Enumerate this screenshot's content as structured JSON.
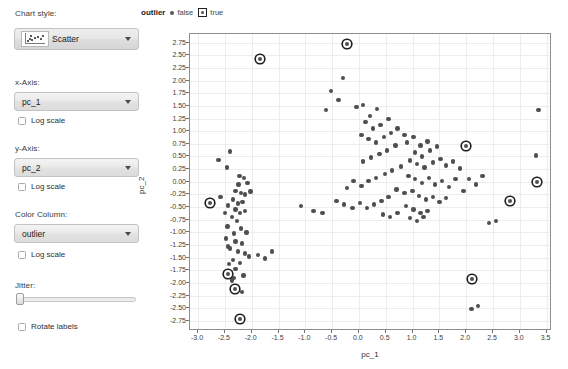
{
  "sidebar": {
    "chart_style_label": "Chart style:",
    "chart_style_value": "Scatter",
    "x_axis_label": "x-Axis:",
    "x_axis_value": "pc_1",
    "x_log_label": "Log scale",
    "y_axis_label": "y-Axis:",
    "y_axis_value": "pc_2",
    "y_log_label": "Log scale",
    "color_column_label": "Color Column:",
    "color_column_value": "outlier",
    "color_log_label": "Log scale",
    "jitter_label": "Jitter:",
    "rotate_labels_label": "Rotate labels"
  },
  "legend": {
    "title": "outlier",
    "items": [
      {
        "label": "false",
        "marker": "dot"
      },
      {
        "label": "true",
        "marker": "boxed-dot"
      }
    ]
  },
  "colors": {
    "point": "#4f4f52",
    "outlier_box": "#1f1f1f",
    "grid": "#ededed",
    "frame": "#8d8d8d",
    "panel": "#e4e4e4"
  },
  "chart_data": {
    "type": "scatter",
    "title": "",
    "xlabel": "pc_1",
    "ylabel": "pc_2",
    "xlim": [
      -3.15,
      3.6
    ],
    "ylim": [
      -2.95,
      2.92
    ],
    "xticks": [
      -3.0,
      -2.5,
      -2.0,
      -1.5,
      -1.0,
      -0.5,
      0.0,
      0.5,
      1.0,
      1.5,
      2.0,
      2.5,
      3.0,
      3.5
    ],
    "yticks": [
      2.75,
      2.5,
      2.25,
      2.0,
      1.75,
      1.5,
      1.25,
      1.0,
      0.75,
      0.5,
      0.25,
      0.0,
      -0.25,
      -0.5,
      -0.75,
      -1.0,
      -1.25,
      -1.5,
      -1.75,
      -2.0,
      -2.25,
      -2.5,
      -2.75
    ],
    "xtick_labels": [
      "-3.0",
      "-2.5",
      "-2.0",
      "-1.5",
      "-1.0",
      "-0.5",
      "0.0",
      "0.5",
      "1.0",
      "1.5",
      "2.0",
      "2.5",
      "3.0",
      "3.5"
    ],
    "ytick_labels": [
      "2.75",
      "2.50",
      "2.25",
      "2.00",
      "1.75",
      "1.50",
      "1.25",
      "1.00",
      "0.75",
      "0.50",
      "0.25",
      "0.00",
      "-0.25",
      "-0.50",
      "-0.75",
      "-1.00",
      "-1.25",
      "-1.50",
      "-1.75",
      "-2.00",
      "-2.25",
      "-2.50",
      "-2.75"
    ],
    "grid": true,
    "legend_position": "top-left-outside",
    "color_by": "outlier",
    "series": [
      {
        "name": "false",
        "marker": "circle",
        "color": "#4f4f52",
        "points": [
          [
            -2.62,
            0.43
          ],
          [
            -2.4,
            0.6
          ],
          [
            -2.46,
            0.28
          ],
          [
            -2.23,
            0.12
          ],
          [
            -2.14,
            0.07
          ],
          [
            -2.25,
            -0.05
          ],
          [
            -2.08,
            -0.02
          ],
          [
            -2.3,
            -0.18
          ],
          [
            -2.2,
            -0.22
          ],
          [
            -2.13,
            -0.25
          ],
          [
            -2.02,
            -0.19
          ],
          [
            -2.35,
            -0.35
          ],
          [
            -2.44,
            -0.47
          ],
          [
            -2.26,
            -0.43
          ],
          [
            -2.17,
            -0.4
          ],
          [
            -2.3,
            -0.55
          ],
          [
            -2.22,
            -0.62
          ],
          [
            -2.12,
            -0.58
          ],
          [
            -2.37,
            -0.7
          ],
          [
            -2.28,
            -0.78
          ],
          [
            -2.45,
            -0.88
          ],
          [
            -2.2,
            -0.92
          ],
          [
            -2.33,
            -1.02
          ],
          [
            -2.1,
            -1.0
          ],
          [
            -2.48,
            -1.12
          ],
          [
            -2.3,
            -1.18
          ],
          [
            -2.18,
            -1.22
          ],
          [
            -2.4,
            -1.32
          ],
          [
            -2.26,
            -1.38
          ],
          [
            -2.12,
            -1.42
          ],
          [
            -2.35,
            -1.55
          ],
          [
            -2.22,
            -1.6
          ],
          [
            -2.05,
            -1.48
          ],
          [
            -2.3,
            -1.72
          ],
          [
            -2.44,
            -1.28
          ],
          [
            -2.15,
            -1.85
          ],
          [
            -2.37,
            -1.95
          ],
          [
            -2.28,
            -2.06
          ],
          [
            -2.18,
            -2.18
          ],
          [
            -2.58,
            -0.3
          ],
          [
            -2.5,
            -0.62
          ],
          [
            -2.42,
            -1.62
          ],
          [
            -2.33,
            -1.9
          ],
          [
            -0.52,
            1.8
          ],
          [
            -0.38,
            1.62
          ],
          [
            -0.3,
            2.05
          ],
          [
            -0.62,
            1.42
          ],
          [
            -0.05,
            1.48
          ],
          [
            0.08,
            1.52
          ],
          [
            0.2,
            1.3
          ],
          [
            0.34,
            1.44
          ],
          [
            0.12,
            1.18
          ],
          [
            0.26,
            1.05
          ],
          [
            0.4,
            1.12
          ],
          [
            0.55,
            1.24
          ],
          [
            0.05,
            0.92
          ],
          [
            0.18,
            0.85
          ],
          [
            0.32,
            0.78
          ],
          [
            0.47,
            0.88
          ],
          [
            0.6,
            0.96
          ],
          [
            0.72,
            1.05
          ],
          [
            0.85,
            0.92
          ],
          [
            0.68,
            0.72
          ],
          [
            0.52,
            0.62
          ],
          [
            0.38,
            0.55
          ],
          [
            0.22,
            0.48
          ],
          [
            0.08,
            0.4
          ],
          [
            0.9,
            0.78
          ],
          [
            1.02,
            0.88
          ],
          [
            1.15,
            0.72
          ],
          [
            1.28,
            0.8
          ],
          [
            1.05,
            0.58
          ],
          [
            1.18,
            0.5
          ],
          [
            1.32,
            0.62
          ],
          [
            1.45,
            0.7
          ],
          [
            0.95,
            0.42
          ],
          [
            1.08,
            0.35
          ],
          [
            1.22,
            0.28
          ],
          [
            1.38,
            0.38
          ],
          [
            1.52,
            0.45
          ],
          [
            1.62,
            0.32
          ],
          [
            1.75,
            0.4
          ],
          [
            1.88,
            0.26
          ],
          [
            0.78,
            0.3
          ],
          [
            0.62,
            0.22
          ],
          [
            0.48,
            0.15
          ],
          [
            0.32,
            0.08
          ],
          [
            0.18,
            0.02
          ],
          [
            0.05,
            -0.08
          ],
          [
            -0.1,
            0.02
          ],
          [
            -0.22,
            -0.12
          ],
          [
            0.92,
            0.12
          ],
          [
            1.05,
            0.05
          ],
          [
            1.18,
            -0.02
          ],
          [
            1.3,
            0.08
          ],
          [
            1.42,
            -0.05
          ],
          [
            1.55,
            0.02
          ],
          [
            1.68,
            -0.1
          ],
          [
            1.8,
            0.05
          ],
          [
            0.7,
            -0.15
          ],
          [
            0.85,
            -0.22
          ],
          [
            1.0,
            -0.18
          ],
          [
            1.12,
            -0.28
          ],
          [
            1.25,
            -0.35
          ],
          [
            1.38,
            -0.3
          ],
          [
            1.5,
            -0.4
          ],
          [
            1.62,
            -0.32
          ],
          [
            0.55,
            -0.3
          ],
          [
            0.42,
            -0.38
          ],
          [
            0.28,
            -0.45
          ],
          [
            0.15,
            -0.52
          ],
          [
            0.02,
            -0.42
          ],
          [
            -0.12,
            -0.52
          ],
          [
            -0.28,
            -0.45
          ],
          [
            -0.42,
            -0.38
          ],
          [
            0.88,
            -0.48
          ],
          [
            1.02,
            -0.55
          ],
          [
            1.15,
            -0.62
          ],
          [
            1.28,
            -0.58
          ],
          [
            0.72,
            -0.62
          ],
          [
            0.58,
            -0.7
          ],
          [
            0.45,
            -0.65
          ],
          [
            0.95,
            -0.72
          ],
          [
            1.08,
            -0.78
          ],
          [
            1.2,
            -0.7
          ],
          [
            2.05,
            0.05
          ],
          [
            2.18,
            -0.05
          ],
          [
            1.95,
            -0.18
          ],
          [
            2.3,
            0.12
          ],
          [
            2.42,
            -0.82
          ],
          [
            2.55,
            -0.78
          ],
          [
            3.35,
            1.42
          ],
          [
            3.3,
            0.52
          ],
          [
            -1.08,
            -0.48
          ],
          [
            -0.85,
            -0.58
          ],
          [
            -0.68,
            -0.62
          ],
          [
            2.1,
            -2.52
          ],
          [
            2.22,
            -2.45
          ],
          [
            -1.62,
            -1.38
          ],
          [
            -1.75,
            -1.52
          ],
          [
            -1.88,
            -1.45
          ]
        ]
      },
      {
        "name": "true",
        "marker": "boxed-circle",
        "color": "#4f4f52",
        "points": [
          [
            -1.85,
            2.42
          ],
          [
            -0.22,
            2.72
          ],
          [
            -2.78,
            -0.42
          ],
          [
            -2.45,
            -1.82
          ],
          [
            -2.32,
            -2.12
          ],
          [
            -2.22,
            -2.72
          ],
          [
            2.0,
            0.7
          ],
          [
            3.32,
            0.0
          ],
          [
            2.82,
            -0.38
          ],
          [
            2.1,
            -1.92
          ]
        ]
      }
    ]
  }
}
